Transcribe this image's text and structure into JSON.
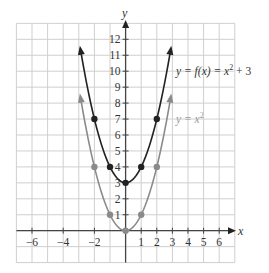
{
  "chart_data": {
    "type": "line",
    "title": "",
    "xlabel": "x",
    "ylabel": "y",
    "xlim": [
      -7,
      7
    ],
    "ylim": [
      -2,
      13
    ],
    "grid": true,
    "x_ticks": [
      -6,
      -4,
      -2,
      1,
      2,
      3,
      4,
      5,
      6
    ],
    "x_tick_labels": [
      "−6",
      "−4",
      "−2",
      "1",
      "2",
      "3",
      "4",
      "5",
      "6"
    ],
    "y_ticks": [
      1,
      2,
      3,
      4,
      5,
      6,
      7,
      8,
      9,
      10,
      11,
      12
    ],
    "y_tick_labels": [
      "1",
      "2",
      "3",
      "4",
      "5",
      "6",
      "7",
      "8",
      "9",
      "10",
      "11",
      "12"
    ],
    "series": [
      {
        "name": "y = f(x) = x² + 3",
        "function": "x^2 + 3",
        "color": "#222222",
        "x_range": [
          -2.9,
          2.9
        ],
        "points": [
          {
            "x": -2,
            "y": 7
          },
          {
            "x": -1,
            "y": 4
          },
          {
            "x": 0,
            "y": 3
          },
          {
            "x": 1,
            "y": 4
          },
          {
            "x": 2,
            "y": 7
          }
        ],
        "label_position": {
          "x": 3.2,
          "y": 10
        }
      },
      {
        "name": "y = x²",
        "function": "x^2",
        "color": "#8a8a8a",
        "x_range": [
          -2.9,
          2.9
        ],
        "points": [
          {
            "x": -2,
            "y": 4
          },
          {
            "x": -1,
            "y": 1
          },
          {
            "x": 0,
            "y": 0
          },
          {
            "x": 1,
            "y": 1
          },
          {
            "x": 2,
            "y": 4
          }
        ],
        "label_position": {
          "x": 3.2,
          "y": 7
        }
      }
    ],
    "annotations": [
      {
        "text": "y = f(x) = x² + 3",
        "series": 0
      },
      {
        "text": "y = x²",
        "series": 1
      }
    ]
  },
  "labels": {
    "x_axis": "x",
    "y_axis": "y",
    "series0_main": "y = f(x) = x",
    "series0_exp": "2",
    "series0_tail": " + 3",
    "series1_main": "y = x",
    "series1_exp": "2"
  },
  "colors": {
    "grid": "#cfcfcf",
    "axis": "#444444",
    "series0": "#222222",
    "series1": "#8a8a8a"
  }
}
